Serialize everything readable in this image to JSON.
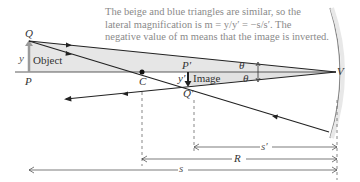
{
  "caption": {
    "line1": "The beige and blue triangles are similar, so the",
    "line2": "lateral magnification is m = y/y′ = −s/s′. The",
    "line3": "negative value of m means that the image is inverted."
  },
  "labels": {
    "Q": "Q",
    "P": "P",
    "y": "y",
    "object": "Object",
    "C": "C",
    "P_prime": "P′",
    "Q_prime": "Q′",
    "y_prime": "y′",
    "image": "Image",
    "theta_top": "θ",
    "theta_bottom": "θ",
    "V": "V",
    "s_prime": "s′",
    "R": "R",
    "s": "s"
  },
  "colors": {
    "ray": "#222222",
    "object_arrow": "#9a9a9a",
    "beige_triangle": "#e6e6e6",
    "blue_triangle": "#e3e3e3",
    "mirror": "#777777",
    "caption": "#8a8a8a"
  }
}
